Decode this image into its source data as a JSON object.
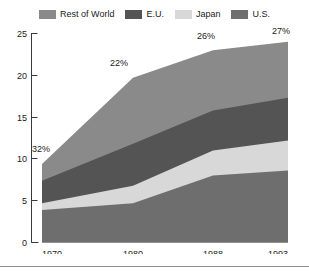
{
  "legend": {
    "items": [
      {
        "label": "Rest of World",
        "color": "#8a8a8a",
        "key": "rest_of_world"
      },
      {
        "label": "E.U.",
        "color": "#545454",
        "key": "eu"
      },
      {
        "label": "Japan",
        "color": "#d8d8d8",
        "key": "japan"
      },
      {
        "label": "U.S.",
        "color": "#6e6e6e",
        "key": "us"
      }
    ]
  },
  "axes": {
    "y_ticks": [
      "0",
      "5",
      "10",
      "15",
      "20",
      "25"
    ],
    "x_ticks": [
      "1970",
      "1980",
      "1988",
      "1993"
    ]
  },
  "annotations": [
    {
      "text": "32%",
      "x": 1970
    },
    {
      "text": "22%",
      "x": 1980
    },
    {
      "text": "26%",
      "x": 1988
    },
    {
      "text": "27%",
      "x": 1993
    }
  ],
  "chart_data": {
    "type": "area",
    "title": "",
    "subtitle": "",
    "xlabel": "",
    "ylabel": "",
    "stacked": true,
    "grid": false,
    "legend_position": "top",
    "categories": [
      "1970",
      "1980",
      "1988",
      "1993"
    ],
    "x": [
      1970,
      1980,
      1988,
      1993
    ],
    "ylim": [
      0,
      25
    ],
    "ytick_values": [
      0,
      5,
      10,
      15,
      20,
      25
    ],
    "series": [
      {
        "name": "U.S.",
        "color": "#6e6e6e",
        "values": [
          3.9,
          4.7,
          8.0,
          8.6
        ]
      },
      {
        "name": "Japan",
        "color": "#d8d8d8",
        "values": [
          0.8,
          2.1,
          3.0,
          3.6
        ]
      },
      {
        "name": "E.U.",
        "color": "#545454",
        "values": [
          2.7,
          5.0,
          4.8,
          5.1
        ]
      },
      {
        "name": "Rest of World",
        "color": "#8a8a8a",
        "values": [
          2.0,
          7.9,
          7.2,
          6.7
        ]
      }
    ],
    "cumulative_tops": {
      "us": [
        3.9,
        4.7,
        8.0,
        8.6
      ],
      "japan": [
        4.7,
        6.8,
        11.0,
        12.2
      ],
      "eu": [
        7.4,
        11.8,
        15.8,
        17.3
      ],
      "total": [
        9.4,
        19.7,
        23.0,
        24.0
      ]
    },
    "annotation_labels": [
      "32%",
      "22%",
      "26%",
      "27%"
    ],
    "annotation_note": "Percentage labels mark the Rest of World share of the total at each year."
  }
}
